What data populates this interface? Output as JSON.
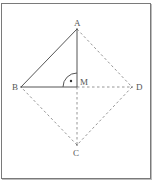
{
  "diagram": {
    "type": "geometry",
    "points": {
      "A": {
        "label": "A",
        "x": 77,
        "y": 29
      },
      "B": {
        "label": "B",
        "x": 21,
        "y": 87
      },
      "C": {
        "label": "C",
        "x": 77,
        "y": 145
      },
      "D": {
        "label": "D",
        "x": 132,
        "y": 87
      },
      "M": {
        "label": "M",
        "x": 77,
        "y": 87
      }
    },
    "solid_segments": [
      "AB",
      "AM",
      "BM"
    ],
    "dashed_segments": [
      "AD",
      "DC",
      "CB",
      "MD",
      "MC"
    ],
    "right_angle_marker": {
      "at": "M",
      "between": [
        "MA",
        "MB"
      ],
      "style": "arc with dot"
    },
    "colors": {
      "line": "#555555",
      "dashed": "#8a8a8a",
      "label": "#555555",
      "frame": "#7a7a7a"
    }
  }
}
